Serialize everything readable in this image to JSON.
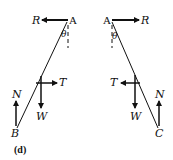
{
  "figure": {
    "caption": "(d)",
    "left": {
      "top_point": "A",
      "bottom_point": "B",
      "angle": "θ",
      "forces": {
        "reaction": "R",
        "tension": "T",
        "weight": "W",
        "normal": "N"
      }
    },
    "right": {
      "top_point": "A",
      "bottom_point": "C",
      "angle": "θ",
      "forces": {
        "reaction": "R",
        "tension": "T",
        "weight": "W",
        "normal": "N"
      }
    }
  },
  "colors": {
    "ink": "#111111",
    "background": "#ffffff"
  }
}
